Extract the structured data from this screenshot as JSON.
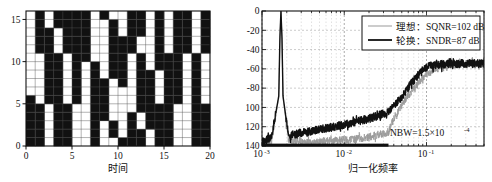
{
  "figure": {
    "background": "#ffffff",
    "ink": "#111111"
  },
  "chart_data": [
    {
      "id": "element-rotation-map",
      "type": "heatmap",
      "title": "",
      "xlabel": "时间",
      "ylabel": "",
      "xlim": [
        0,
        20
      ],
      "ylim": [
        0,
        16
      ],
      "xticks": [
        0,
        5,
        10,
        15,
        20
      ],
      "xtick_labels": [
        "0",
        "5",
        "10",
        "15",
        "20"
      ],
      "yticks": [
        0,
        5,
        10,
        15
      ],
      "ytick_labels": [
        "0",
        "5",
        "10",
        "15"
      ],
      "grid": true,
      "cell_colors": {
        "on": "#111111",
        "off": "#ffffff"
      },
      "n_cols": 20,
      "n_rows": 16,
      "note": "rows listed bottom (y=0) to top (y=15); 1 = black selected element, 0 = white",
      "matrix": [
        [
          1,
          1,
          0,
          1,
          1,
          0,
          0,
          1,
          0,
          0,
          1,
          1,
          1,
          0,
          1,
          1,
          0,
          0,
          1,
          1
        ],
        [
          1,
          1,
          0,
          1,
          1,
          0,
          0,
          1,
          0,
          1,
          0,
          1,
          1,
          0,
          1,
          1,
          0,
          0,
          1,
          1
        ],
        [
          1,
          1,
          0,
          1,
          1,
          0,
          0,
          1,
          0,
          1,
          0,
          1,
          0,
          1,
          1,
          1,
          0,
          0,
          1,
          1
        ],
        [
          1,
          1,
          0,
          1,
          1,
          0,
          0,
          1,
          1,
          0,
          0,
          1,
          0,
          1,
          1,
          1,
          0,
          0,
          1,
          1
        ],
        [
          1,
          1,
          0,
          1,
          1,
          0,
          0,
          1,
          1,
          0,
          0,
          0,
          1,
          1,
          1,
          1,
          0,
          0,
          1,
          1
        ],
        [
          1,
          0,
          1,
          1,
          0,
          1,
          0,
          1,
          1,
          0,
          0,
          0,
          1,
          1,
          0,
          1,
          1,
          0,
          1,
          0
        ],
        [
          0,
          0,
          1,
          1,
          0,
          1,
          0,
          1,
          1,
          0,
          0,
          0,
          1,
          1,
          0,
          1,
          1,
          0,
          1,
          0
        ],
        [
          0,
          0,
          1,
          1,
          0,
          1,
          0,
          1,
          1,
          0,
          1,
          0,
          1,
          1,
          0,
          1,
          1,
          0,
          1,
          0
        ],
        [
          0,
          0,
          1,
          1,
          0,
          1,
          0,
          1,
          0,
          1,
          1,
          0,
          1,
          1,
          0,
          1,
          1,
          0,
          1,
          0
        ],
        [
          0,
          0,
          1,
          1,
          0,
          1,
          0,
          1,
          0,
          1,
          1,
          0,
          1,
          0,
          1,
          1,
          1,
          0,
          1,
          0
        ],
        [
          0,
          0,
          1,
          1,
          0,
          1,
          1,
          0,
          0,
          1,
          1,
          0,
          1,
          0,
          1,
          1,
          1,
          0,
          1,
          0
        ],
        [
          0,
          1,
          1,
          0,
          1,
          1,
          1,
          0,
          0,
          1,
          1,
          1,
          0,
          0,
          1,
          0,
          1,
          1,
          0,
          1
        ],
        [
          0,
          1,
          1,
          0,
          1,
          1,
          1,
          0,
          0,
          1,
          1,
          1,
          0,
          0,
          1,
          0,
          1,
          1,
          0,
          1
        ],
        [
          0,
          1,
          1,
          0,
          1,
          1,
          1,
          0,
          0,
          1,
          0,
          1,
          1,
          0,
          1,
          0,
          1,
          1,
          0,
          1
        ],
        [
          0,
          1,
          0,
          1,
          1,
          1,
          1,
          0,
          0,
          1,
          0,
          1,
          1,
          0,
          1,
          0,
          1,
          1,
          0,
          1
        ],
        [
          0,
          1,
          0,
          1,
          1,
          1,
          1,
          0,
          1,
          0,
          0,
          1,
          1,
          0,
          1,
          0,
          1,
          1,
          0,
          1
        ]
      ]
    },
    {
      "id": "output-spectrum",
      "type": "line",
      "title": "",
      "xlabel": "归一化频率",
      "ylabel": "",
      "xscale": "log",
      "xlim": [
        0.001,
        0.5
      ],
      "ylim": [
        -140,
        0
      ],
      "yticks": [
        0,
        -20,
        -40,
        -60,
        -80,
        -100,
        -120,
        -140
      ],
      "ytick_labels": [
        "0",
        "-20",
        "-40",
        "-60",
        "-80",
        "-100",
        "-120",
        "-140"
      ],
      "xticks": [
        0.001,
        0.01,
        0.1
      ],
      "xtick_labels": [
        "10⁻³",
        "10⁻²",
        "10⁻¹"
      ],
      "grid": true,
      "legend_position": "top-right",
      "annotations": [
        {
          "text": "NBW=1.5×10⁻⁴",
          "x": 0.09,
          "y": -128
        }
      ],
      "series": [
        {
          "name": "理想：SQNR=102 dB",
          "short_name": "理想",
          "metric": "SQNR",
          "value_db": 102,
          "color": "#999999",
          "linewidth": 0.8,
          "description": "ideal DAC spectrum: tone peak at 0 dB near f=0.0017, noise floor ~ -135 dB rising slowly",
          "x": [
            0.001,
            0.0013,
            0.0016,
            0.00165,
            0.0017,
            0.00175,
            0.0018,
            0.0021,
            0.0026,
            0.0035,
            0.005,
            0.007,
            0.01,
            0.014,
            0.02,
            0.028,
            0.0345,
            0.036,
            0.04,
            0.05,
            0.07,
            0.1,
            0.15,
            0.2,
            0.3,
            0.5
          ],
          "y": [
            -138,
            -136,
            -90,
            -30,
            0,
            -30,
            -90,
            -134,
            -136,
            -137,
            -136,
            -135,
            -134,
            -133,
            -131,
            -128,
            -126,
            -122,
            -112,
            -98,
            -80,
            -66,
            -58,
            -56,
            -55,
            -55
          ]
        },
        {
          "name": "轮换：SNDR=87 dB",
          "short_name": "轮换",
          "metric": "SNDR",
          "value_db": 87,
          "color": "#111111",
          "linewidth": 1.4,
          "description": "rotation (DEM) spectrum: tone peak at 0 dB, shaped noise floor rising from -128 dB to -55 dB",
          "x": [
            0.001,
            0.0013,
            0.0016,
            0.00165,
            0.0017,
            0.00175,
            0.0018,
            0.0021,
            0.0026,
            0.0035,
            0.005,
            0.007,
            0.01,
            0.014,
            0.02,
            0.028,
            0.0345,
            0.04,
            0.05,
            0.06,
            0.07,
            0.085,
            0.1,
            0.13,
            0.2,
            0.3,
            0.5
          ],
          "y": [
            -136,
            -132,
            -88,
            -28,
            0,
            -28,
            -88,
            -130,
            -128,
            -126,
            -123,
            -121,
            -118,
            -115,
            -112,
            -108,
            -105,
            -99,
            -90,
            -80,
            -72,
            -64,
            -59,
            -56,
            -55,
            -55,
            -55
          ]
        }
      ],
      "baseline_bar": {
        "description": "thick black in-band signal-band marker along bottom axis",
        "x_start": 0.001,
        "x_end": 0.0345,
        "y": -139
      }
    }
  ],
  "panel_left": {
    "name": "element-rotation-map",
    "xlabel": "时间",
    "xtick_labels": [
      "0",
      "5",
      "10",
      "15",
      "20"
    ],
    "ytick_labels": [
      "0",
      "5",
      "10",
      "15"
    ]
  },
  "panel_right": {
    "name": "output-spectrum",
    "xlabel": "归一化频率",
    "ytick_labels": [
      "0",
      "-20",
      "-40",
      "-60",
      "-80",
      "-100",
      "-120",
      "-140"
    ],
    "xtick_mantissa": "10",
    "xtick_exponents": [
      "-3",
      "-2",
      "-1"
    ],
    "legend": {
      "items": [
        {
          "label": "理想：SQNR=102 dB",
          "color": "#999999"
        },
        {
          "label": "轮换：SNDR=87 dB",
          "color": "#111111"
        }
      ]
    },
    "annotation": {
      "prefix": "NBW=1.5×10",
      "exponent": "-4"
    }
  }
}
